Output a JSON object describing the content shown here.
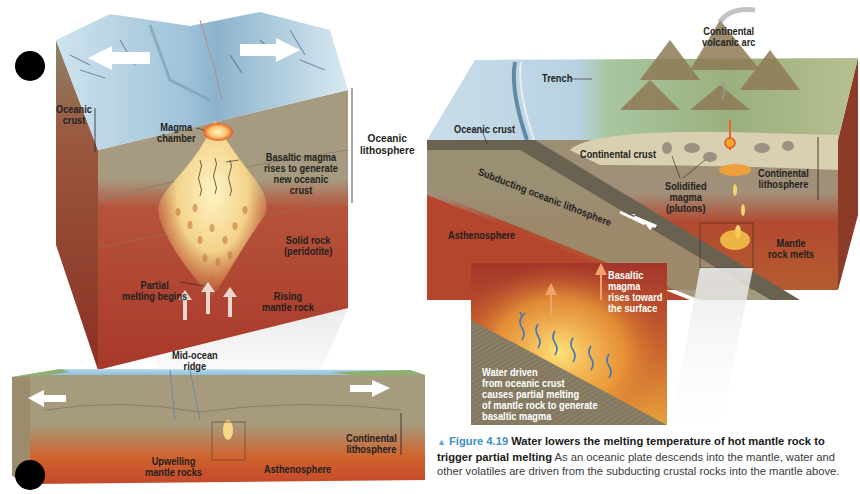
{
  "figure": {
    "number": "Figure 4.19",
    "title": "Water lowers the melting temperature of hot mantle rock to trigger partial melting",
    "body": "As an oceanic plate descends into the mantle, water and other volatiles are driven from the subducting crustal rocks into the mantle above."
  },
  "left_panel": {
    "top_block": {
      "labels": {
        "oceanic_crust": [
          "Oceanic",
          "crust"
        ],
        "magma_chamber": [
          "Magma",
          "chamber"
        ],
        "oceanic_lithosphere": [
          "Oceanic",
          "lithosphere"
        ],
        "basaltic_magma": [
          "Basaltic magma",
          "rises to generate",
          "new oceanic",
          "crust"
        ],
        "solid_rock": [
          "Solid rock",
          "(peridotite)"
        ],
        "partial_melting": [
          "Partial",
          "melting begins"
        ],
        "rising_mantle": [
          "Rising",
          "mantle rock"
        ]
      }
    },
    "bottom_block": {
      "labels": {
        "mid_ocean_ridge": [
          "Mid-ocean",
          "ridge"
        ],
        "continental_lithosphere": [
          "Continental",
          "lithosphere"
        ],
        "upwelling": [
          "Upwelling",
          "mantle rocks"
        ],
        "asthenosphere": "Asthenosphere"
      }
    }
  },
  "right_panel": {
    "labels": {
      "volcanic_arc": [
        "Continental",
        "volcanic arc"
      ],
      "trench": "Trench",
      "oceanic_crust": "Oceanic crust",
      "continental_crust": "Continental crust",
      "subducting": "Subducting oceanic lithosphere",
      "solidified_magma": [
        "Solidified",
        "magma",
        "(plutons)"
      ],
      "continental_lithosphere": [
        "Continental",
        "lithosphere"
      ],
      "asthenosphere": "Asthenosphere",
      "mantle_melts": [
        "Mantle",
        "rock melts"
      ]
    },
    "inset": {
      "basaltic_magma": [
        "Basaltic",
        "magma",
        "rises toward",
        "the surface"
      ],
      "water_driven": [
        "Water driven",
        "from oceanic crust",
        "causes partial melting",
        "of mantle rock to generate",
        "basaltic magma"
      ]
    }
  },
  "colors": {
    "mantle_red": "#b5432a",
    "crust_tan": "#a89c80",
    "ocean_blue": "#8fbfdc",
    "magma_yellow": "#f6d77a",
    "caption_blue": "#3b8fc7"
  }
}
